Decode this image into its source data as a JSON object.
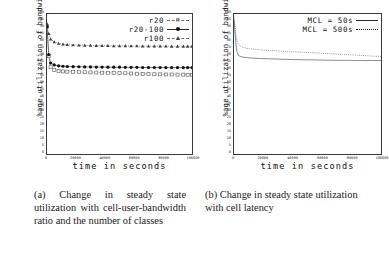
{
  "figure": {
    "panels": [
      {
        "id": "a",
        "caption": "(a) Change in steady state utilization with cell-user-bandwidth ratio and the number of classes"
      },
      {
        "id": "b",
        "caption": "(b) Change in steady state utilization with cell latency"
      }
    ]
  },
  "chart_data": [
    {
      "type": "line",
      "title": "",
      "xlabel": "time in seconds",
      "ylabel": "%age utilization of bandwidth",
      "xlim": [
        0,
        100000
      ],
      "ylim": [
        0,
        100
      ],
      "xticks": [
        0,
        20000,
        40000,
        60000,
        80000,
        100000
      ],
      "xticklabels": [
        "0",
        "20000",
        "40000",
        "60000",
        "80000",
        "100000"
      ],
      "yticks": [
        0,
        5,
        10,
        15,
        20,
        25,
        30,
        35,
        40,
        45,
        50,
        55,
        60,
        65,
        70,
        75,
        80,
        85,
        90,
        95,
        100
      ],
      "yticklabels": [
        "0",
        "5",
        "10",
        "15",
        "20",
        "25",
        "30",
        "35",
        "40",
        "45",
        "50",
        "55",
        "60",
        "65",
        "70",
        "75",
        "80",
        "85",
        "90",
        "95",
        "100"
      ],
      "grid": false,
      "legend_position": "top-right",
      "series": [
        {
          "name": "r20",
          "marker": "open-square",
          "line": "dashed",
          "color": "#6f6f6f",
          "x": [
            0,
            1200,
            2500,
            5000,
            8000,
            11000,
            14000,
            18000,
            22000,
            26000,
            30000,
            34000,
            38000,
            42000,
            46000,
            50000,
            54000,
            58000,
            62000,
            66000,
            70000,
            74000,
            78000,
            82000,
            86000,
            90000,
            94000,
            97000,
            100000
          ],
          "y": [
            91,
            70,
            62,
            60,
            59.4,
            59,
            58.8,
            58.6,
            58.5,
            58.4,
            58.3,
            58.2,
            58.1,
            58.0,
            57.9,
            57.8,
            57.7,
            57.5,
            57.3,
            57.2,
            57.1,
            57.0,
            56.9,
            56.8,
            56.8,
            56.7,
            56.7,
            56.6,
            56.6
          ]
        },
        {
          "name": "r20-100",
          "marker": "filled-circle",
          "line": "solid",
          "color": "#121212",
          "x": [
            0,
            1200,
            2500,
            5000,
            8000,
            11000,
            14000,
            18000,
            22000,
            26000,
            30000,
            34000,
            38000,
            42000,
            46000,
            50000,
            54000,
            58000,
            62000,
            66000,
            70000,
            74000,
            78000,
            82000,
            86000,
            90000,
            94000,
            97000,
            100000
          ],
          "y": [
            91,
            71,
            65,
            63.6,
            63.0,
            62.7,
            62.5,
            62.4,
            62.3,
            62.2,
            62.2,
            62.1,
            62.1,
            62.0,
            62.0,
            62.0,
            61.9,
            61.9,
            61.9,
            61.8,
            61.8,
            61.8,
            61.8,
            61.7,
            61.7,
            61.7,
            61.7,
            61.7,
            61.7
          ]
        },
        {
          "name": "r100",
          "marker": "filled-triangle",
          "line": "dashed",
          "color": "#3d3d3d",
          "x": [
            0,
            1200,
            2500,
            5000,
            8000,
            11000,
            14000,
            18000,
            22000,
            26000,
            30000,
            34000,
            38000,
            42000,
            46000,
            50000,
            54000,
            58000,
            62000,
            66000,
            70000,
            74000,
            78000,
            82000,
            86000,
            90000,
            94000,
            97000,
            100000
          ],
          "y": [
            93,
            86,
            82,
            80,
            79,
            78.4,
            78.1,
            77.9,
            77.7,
            77.6,
            77.5,
            77.4,
            77.3,
            77.3,
            77.2,
            77.2,
            77.1,
            77.1,
            77.1,
            77.0,
            77.0,
            77.0,
            77.0,
            77.0,
            76.9,
            76.9,
            76.9,
            76.9,
            76.9
          ]
        }
      ]
    },
    {
      "type": "line",
      "title": "",
      "xlabel": "time in seconds",
      "ylabel": "%age utilization of bandwidth",
      "xlim": [
        0,
        100000
      ],
      "ylim": [
        0,
        100
      ],
      "xticks": [
        0,
        20000,
        40000,
        60000,
        80000,
        100000
      ],
      "xticklabels": [
        "0",
        "20000",
        "40000",
        "60000",
        "80000",
        "100000"
      ],
      "yticks": [
        0,
        5,
        10,
        15,
        20,
        25,
        30,
        35,
        40,
        45,
        50,
        55,
        60,
        65,
        70,
        75,
        80,
        85,
        90,
        95,
        100
      ],
      "yticklabels": [
        "0",
        "5",
        "10",
        "15",
        "20",
        "25",
        "30",
        "35",
        "40",
        "45",
        "50",
        "55",
        "60",
        "65",
        "70",
        "75",
        "80",
        "85",
        "90",
        "95",
        "100"
      ],
      "grid": false,
      "legend_position": "top-right",
      "series": [
        {
          "name": "MCL = 50s",
          "marker": "none",
          "line": "solid",
          "color": "#2b2b2b",
          "x": [
            0,
            600,
            1200,
            2000,
            3000,
            4500,
            6000,
            9000,
            13000,
            18000,
            24000,
            30000,
            36000,
            42000,
            48000,
            54000,
            60000,
            66000,
            72000,
            78000,
            84000,
            90000,
            95000,
            100000
          ],
          "y": [
            96,
            88,
            80,
            73,
            70.5,
            69.6,
            69.2,
            68.8,
            68.5,
            68.2,
            68.0,
            67.8,
            67.6,
            67.4,
            67.3,
            67.2,
            67.1,
            67.0,
            66.9,
            66.9,
            66.8,
            66.8,
            66.8,
            66.7
          ]
        },
        {
          "name": "MCL = 500s",
          "marker": "none",
          "line": "dotted",
          "color": "#2b2b2b",
          "x": [
            0,
            600,
            1200,
            2000,
            3000,
            4500,
            6000,
            9000,
            13000,
            18000,
            24000,
            30000,
            36000,
            42000,
            48000,
            54000,
            60000,
            66000,
            72000,
            78000,
            84000,
            90000,
            95000,
            100000
          ],
          "y": [
            98,
            92,
            86,
            81,
            78.5,
            77.0,
            76.2,
            75.4,
            74.9,
            74.4,
            74.0,
            73.6,
            73.2,
            72.9,
            72.6,
            72.3,
            72.0,
            71.6,
            71.2,
            70.9,
            70.6,
            70.2,
            69.9,
            69.7
          ]
        }
      ]
    }
  ]
}
